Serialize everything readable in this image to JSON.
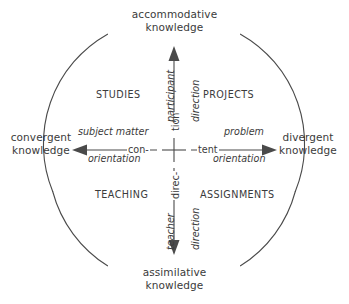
{
  "diagram": {
    "type": "quadrant-circle",
    "stroke_color": "#4a4a4a",
    "text_color": "#3b3b3b",
    "background_color": "#ffffff"
  },
  "poles": {
    "top": {
      "line1": "accommodative",
      "line2": "knowledge"
    },
    "bottom": {
      "line1": "assimilative",
      "line2": "knowledge"
    },
    "left": {
      "line1": "convergent",
      "line2": "knowledge"
    },
    "right": {
      "line1": "divergent",
      "line2": "knowledge"
    }
  },
  "quadrants": {
    "top_left": "STUDIES",
    "top_right": "PROJECTS",
    "bottom_left": "TEACHING",
    "bottom_right": "ASSIGNMENTS"
  },
  "axes": {
    "horizontal": {
      "name": "content",
      "left_part": "con-",
      "right_part": "tent",
      "left_arrow": {
        "line1": "subject matter",
        "line2": "orientation"
      },
      "right_arrow": {
        "line1": "problem",
        "line2": "orientation"
      }
    },
    "vertical": {
      "name": "direction",
      "top_part": "tion",
      "bottom_part": "direc-",
      "up_arrow": {
        "line1": "participant",
        "line2": "direction"
      },
      "down_arrow": {
        "line1": "teacher",
        "line2": "direction"
      }
    }
  }
}
